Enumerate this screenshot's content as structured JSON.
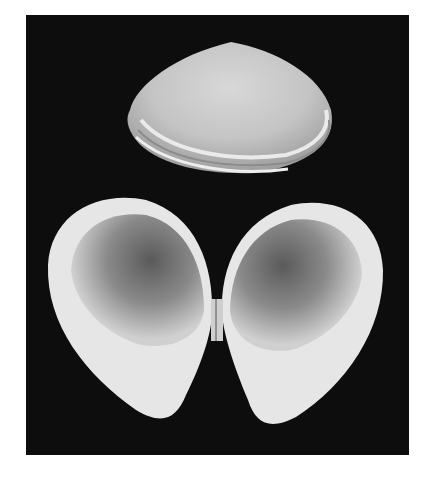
{
  "image": {
    "subject": "bivalve clam shells photographed on black background",
    "colors": {
      "background": "#0d0d0d",
      "page": "#ffffff",
      "shell_light": "#e8e8e8",
      "shell_mid": "#9a9a9a"
    }
  }
}
